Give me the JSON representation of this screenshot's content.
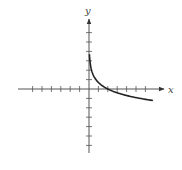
{
  "chart_data": {
    "type": "line",
    "title": "",
    "xlabel": "x",
    "ylabel": "y",
    "xlim": [
      -7.5,
      8
    ],
    "ylim": [
      -7,
      7
    ],
    "grid": false,
    "legend": null,
    "x_ticks": [
      -6,
      -5,
      -4,
      -3,
      -2,
      -1,
      1,
      2,
      3,
      4,
      5,
      6
    ],
    "y_ticks": [
      -6,
      -5,
      -4,
      -3,
      -2,
      -1,
      1,
      2,
      3,
      4,
      5,
      6
    ],
    "tick_labels_shown": false,
    "series": [
      {
        "name": "curve",
        "description": "decreasing logarithmic curve, vertical asymptote at x=0, x-intercept near x=2",
        "x": [
          0.05,
          0.1,
          0.25,
          0.5,
          0.75,
          1,
          1.5,
          2,
          3,
          4,
          5,
          6.8
        ],
        "y": [
          6.3,
          4.6,
          2.4,
          1.4,
          1.0,
          0.7,
          0.3,
          0.0,
          -0.4,
          -0.7,
          -0.9,
          -1.2
        ]
      }
    ],
    "colors": {
      "axis": "#555555",
      "curve": "#222222",
      "background": "#ffffff"
    }
  }
}
